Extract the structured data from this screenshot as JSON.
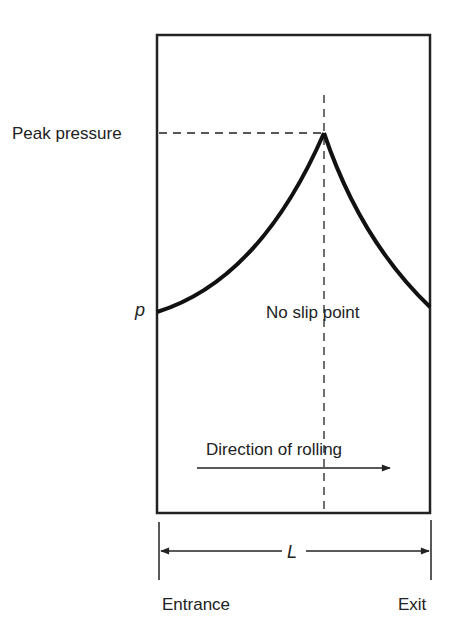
{
  "diagram": {
    "labels": {
      "peak_pressure": "Peak pressure",
      "pressure_symbol": "p",
      "no_slip_point": "No slip point",
      "direction": "Direction of rolling",
      "length_symbol": "L",
      "entrance": "Entrance",
      "exit": "Exit"
    },
    "colors": {
      "ink": "#222222",
      "background": "#ffffff"
    }
  }
}
